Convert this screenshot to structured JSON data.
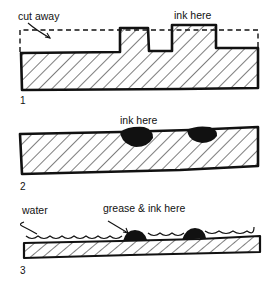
{
  "diagram": {
    "panels": [
      {
        "number": "1",
        "labels": {
          "left": "cut away",
          "right": "ink here"
        },
        "description": "relief block: raised areas carry ink, dashed line shows material cut away"
      },
      {
        "number": "2",
        "labels": {
          "top": "ink here"
        },
        "description": "intaglio plate: ink held in recessed grooves"
      },
      {
        "number": "3",
        "labels": {
          "left": "water",
          "right": "grease & ink here"
        },
        "description": "planographic (lithographic) plate: water repels ink, grease areas accept ink"
      }
    ],
    "colors": {
      "ink": "#111111",
      "background": "#ffffff"
    }
  }
}
